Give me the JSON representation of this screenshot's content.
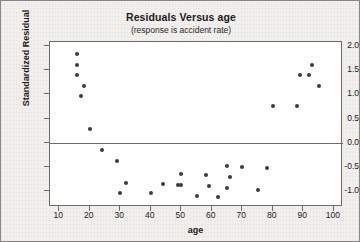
{
  "chart_data": {
    "type": "scatter",
    "title": "Residuals Versus age",
    "subtitle": "(response is accident rate)",
    "xlabel": "age",
    "ylabel": "Standardized Residual",
    "xlim": [
      7,
      103
    ],
    "ylim": [
      -1.32,
      2.08
    ],
    "xticks": [
      10,
      20,
      30,
      40,
      50,
      60,
      70,
      80,
      90,
      100
    ],
    "yticks": [
      2.0,
      1.5,
      1.0,
      0.5,
      0.0,
      -0.5,
      -1.0
    ],
    "ytick_labels": [
      "2.0",
      "1.5",
      "1.0",
      "0.5",
      "0.0",
      "-0.5",
      "-1.0"
    ],
    "xtick_labels": [
      "10",
      "20",
      "30",
      "40",
      "50",
      "60",
      "70",
      "80",
      "90",
      "100"
    ],
    "grid": false,
    "legend": null,
    "reference_line": {
      "orientation": "horizontal",
      "y": 0.0,
      "color": "#6e6a66"
    },
    "marker_color": "#3b3b3b",
    "plot_background": "#ffffff",
    "figure_background": "#f2f0ed",
    "points": [
      {
        "x": 16,
        "y": 1.83
      },
      {
        "x": 16,
        "y": 1.6
      },
      {
        "x": 16,
        "y": 1.4
      },
      {
        "x": 18,
        "y": 1.17
      },
      {
        "x": 17,
        "y": 0.96
      },
      {
        "x": 20,
        "y": 0.29
      },
      {
        "x": 24,
        "y": -0.14
      },
      {
        "x": 29,
        "y": -0.38
      },
      {
        "x": 30,
        "y": -1.03
      },
      {
        "x": 32,
        "y": -0.82
      },
      {
        "x": 40,
        "y": -1.04
      },
      {
        "x": 44,
        "y": -0.84
      },
      {
        "x": 49,
        "y": -0.86
      },
      {
        "x": 50,
        "y": -0.86
      },
      {
        "x": 50,
        "y": -0.64
      },
      {
        "x": 55,
        "y": -1.09
      },
      {
        "x": 58,
        "y": -0.67
      },
      {
        "x": 59,
        "y": -0.89
      },
      {
        "x": 62,
        "y": -1.11
      },
      {
        "x": 65,
        "y": -0.48
      },
      {
        "x": 65,
        "y": -0.92
      },
      {
        "x": 66,
        "y": -0.7
      },
      {
        "x": 70,
        "y": -0.5
      },
      {
        "x": 75,
        "y": -0.96
      },
      {
        "x": 78,
        "y": -0.52
      },
      {
        "x": 80,
        "y": 0.76
      },
      {
        "x": 88,
        "y": 0.76
      },
      {
        "x": 89,
        "y": 1.4
      },
      {
        "x": 92,
        "y": 1.4
      },
      {
        "x": 93,
        "y": 1.6
      },
      {
        "x": 95,
        "y": 1.17
      }
    ]
  }
}
